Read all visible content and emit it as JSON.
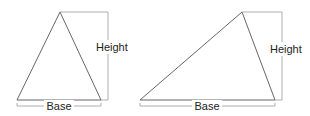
{
  "diagram": {
    "figures": [
      {
        "name": "acute-triangle",
        "apex": [
          60,
          12
        ],
        "base_left": [
          17,
          100
        ],
        "base_right": [
          101,
          100
        ],
        "height_bracket_x": 108,
        "height_label": "Height",
        "height_label_pos": [
          96,
          49
        ],
        "base_label": "Base",
        "base_label_pos": [
          59,
          110
        ]
      },
      {
        "name": "obtuse-triangle",
        "apex": [
          242,
          12
        ],
        "base_left": [
          140,
          100
        ],
        "base_right": [
          275,
          100
        ],
        "height_bracket_x": 282,
        "height_label": "Height",
        "height_label_pos": [
          270,
          52
        ],
        "base_label": "Base",
        "base_label_pos": [
          207,
          110
        ]
      }
    ],
    "colors": {
      "triangle_stroke": "#555555",
      "bracket_stroke": "#9a9a9a",
      "text": "#222222"
    }
  }
}
